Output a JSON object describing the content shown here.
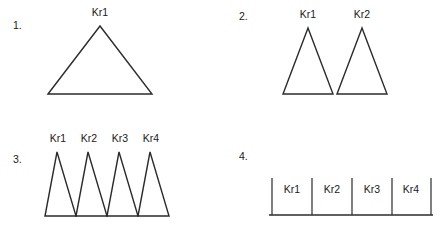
{
  "figure": {
    "background_color": "#ffffff",
    "stroke_color": "#2b2b2b",
    "text_color": "#1a1a1a"
  },
  "panels": [
    {
      "id": "panel-1",
      "number_label": "1.",
      "number_x": 13,
      "number_y": 29,
      "shape_type": "triangle",
      "count": 1,
      "shapes": [
        {
          "label": "Kr1",
          "apex_x": 100,
          "apex_y": 26,
          "base_left_x": 48,
          "base_right_x": 152,
          "base_y": 94,
          "label_x": 100,
          "label_y": 16
        }
      ]
    },
    {
      "id": "panel-2",
      "number_label": "2.",
      "number_x": 239,
      "number_y": 20,
      "shape_type": "triangle",
      "count": 2,
      "shapes": [
        {
          "label": "Kr1",
          "apex_x": 308,
          "apex_y": 28,
          "base_left_x": 283,
          "base_right_x": 333,
          "base_y": 94,
          "label_x": 308,
          "label_y": 18
        },
        {
          "label": "Kr2",
          "apex_x": 362,
          "apex_y": 28,
          "base_left_x": 337,
          "base_right_x": 387,
          "base_y": 94,
          "label_x": 362,
          "label_y": 18
        }
      ]
    },
    {
      "id": "panel-3",
      "number_label": "3.",
      "number_x": 13,
      "number_y": 163,
      "shape_type": "triangle",
      "count": 4,
      "shapes": [
        {
          "label": "Kr1",
          "apex_x": 57,
          "apex_y": 152,
          "base_left_x": 45,
          "base_right_x": 76,
          "base_y": 216,
          "label_x": 58,
          "label_y": 142
        },
        {
          "label": "Kr2",
          "apex_x": 88,
          "apex_y": 152,
          "base_left_x": 76,
          "base_right_x": 107,
          "base_y": 216,
          "label_x": 89,
          "label_y": 142
        },
        {
          "label": "Kr3",
          "apex_x": 119,
          "apex_y": 152,
          "base_left_x": 107,
          "base_right_x": 138,
          "base_y": 216,
          "label_x": 120,
          "label_y": 142
        },
        {
          "label": "Kr4",
          "apex_x": 150,
          "apex_y": 152,
          "base_left_x": 138,
          "base_right_x": 169,
          "base_y": 216,
          "label_x": 151,
          "label_y": 142
        }
      ]
    },
    {
      "id": "panel-4",
      "number_label": "4.",
      "number_x": 239,
      "number_y": 160,
      "shape_type": "number-line",
      "count": 4,
      "axis": {
        "x_start": 269,
        "x_end": 433,
        "y": 215
      },
      "ticks": [
        {
          "x": 272,
          "y_top": 178,
          "y_bottom": 215
        },
        {
          "x": 312,
          "y_top": 178,
          "y_bottom": 215
        },
        {
          "x": 352,
          "y_top": 178,
          "y_bottom": 215
        },
        {
          "x": 392,
          "y_top": 178,
          "y_bottom": 215
        },
        {
          "x": 431,
          "y_top": 178,
          "y_bottom": 215
        }
      ],
      "segments": [
        {
          "label": "Kr1",
          "label_x": 292,
          "label_y": 193
        },
        {
          "label": "Kr2",
          "label_x": 332,
          "label_y": 193
        },
        {
          "label": "Kr3",
          "label_x": 372,
          "label_y": 193
        },
        {
          "label": "Kr4",
          "label_x": 411,
          "label_y": 193
        }
      ]
    }
  ]
}
